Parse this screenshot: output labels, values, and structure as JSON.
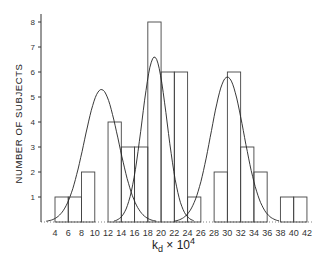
{
  "chart_data": {
    "type": "bar",
    "title": "",
    "xlabel": "k_d × 10^4",
    "ylabel": "NUMBER OF SUBJECTS",
    "x_ticks": [
      4,
      6,
      8,
      10,
      12,
      14,
      16,
      18,
      20,
      22,
      24,
      26,
      28,
      30,
      32,
      34,
      36,
      38,
      40,
      42
    ],
    "y_ticks": [
      1,
      2,
      3,
      4,
      5,
      6,
      7,
      8
    ],
    "xlim": [
      2,
      42
    ],
    "ylim": [
      0,
      8
    ],
    "grid": false,
    "bins": [
      {
        "from": 4,
        "to": 6,
        "count": 1
      },
      {
        "from": 6,
        "to": 8,
        "count": 1
      },
      {
        "from": 8,
        "to": 10,
        "count": 2
      },
      {
        "from": 10,
        "to": 12,
        "count": 0
      },
      {
        "from": 12,
        "to": 14,
        "count": 4
      },
      {
        "from": 14,
        "to": 16,
        "count": 3
      },
      {
        "from": 16,
        "to": 18,
        "count": 3
      },
      {
        "from": 18,
        "to": 20,
        "count": 8
      },
      {
        "from": 20,
        "to": 22,
        "count": 6
      },
      {
        "from": 22,
        "to": 24,
        "count": 6
      },
      {
        "from": 24,
        "to": 26,
        "count": 1
      },
      {
        "from": 26,
        "to": 28,
        "count": 0
      },
      {
        "from": 28,
        "to": 30,
        "count": 2
      },
      {
        "from": 30,
        "to": 32,
        "count": 6
      },
      {
        "from": 32,
        "to": 34,
        "count": 3
      },
      {
        "from": 34,
        "to": 36,
        "count": 2
      },
      {
        "from": 36,
        "to": 38,
        "count": 0
      },
      {
        "from": 38,
        "to": 40,
        "count": 1
      },
      {
        "from": 40,
        "to": 42,
        "count": 1
      }
    ],
    "fitted_curves": [
      {
        "name": "component-1",
        "type": "gaussian",
        "peak_x": 11,
        "peak_y": 5.3
      },
      {
        "name": "component-2",
        "type": "gaussian",
        "peak_x": 19,
        "peak_y": 6.6
      },
      {
        "name": "component-3",
        "type": "gaussian",
        "peak_x": 30,
        "peak_y": 5.8
      }
    ]
  },
  "labels": {
    "ylabel": "NUMBER OF SUBJECTS",
    "xlabel": "kₐ × 10⁴"
  }
}
